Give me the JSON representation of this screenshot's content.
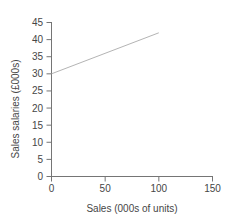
{
  "colors": {
    "background": "#ffffff",
    "axis": "#757575",
    "text": "#464646",
    "line": "#b4b4b4"
  },
  "chart_data": {
    "type": "line",
    "title": "",
    "xlabel": "Sales (000s of units)",
    "ylabel": "Sales salaries (£000s)",
    "xlim": [
      0,
      150
    ],
    "ylim": [
      0,
      45
    ],
    "x_ticks": [
      0,
      50,
      100,
      150
    ],
    "y_ticks": [
      0,
      5,
      10,
      15,
      20,
      25,
      30,
      35,
      40,
      45
    ],
    "grid": false,
    "legend": false,
    "series": [
      {
        "points": [
          [
            0,
            30
          ],
          [
            100,
            42
          ]
        ]
      }
    ]
  }
}
